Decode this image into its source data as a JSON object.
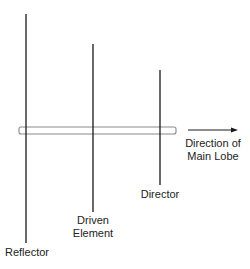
{
  "elements": [
    {
      "name": "reflector",
      "label": "Reflector"
    },
    {
      "name": "driven",
      "label_line1": "Driven",
      "label_line2": "Element"
    },
    {
      "name": "director",
      "label": "Director"
    }
  ],
  "boom": {
    "name": "boom"
  },
  "direction": {
    "line1": "Direction of",
    "line2": "Main Lobe"
  },
  "colors": {
    "line": "#1a1a1a",
    "boom": "#888888"
  }
}
